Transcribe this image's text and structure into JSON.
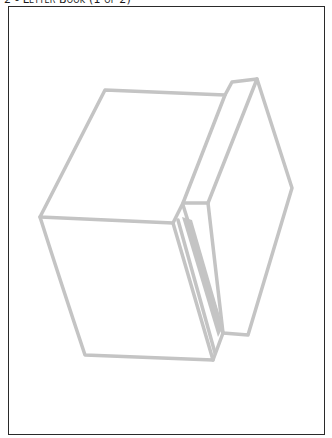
{
  "header": {
    "title": "2 - Letter Book (1 of 2)"
  },
  "illustration": {
    "subject": "box-outline-drawing",
    "stroke_color": "#c4c4c4",
    "fill_color": "#c4c4c4",
    "frame_color": "#2a2a2a"
  }
}
